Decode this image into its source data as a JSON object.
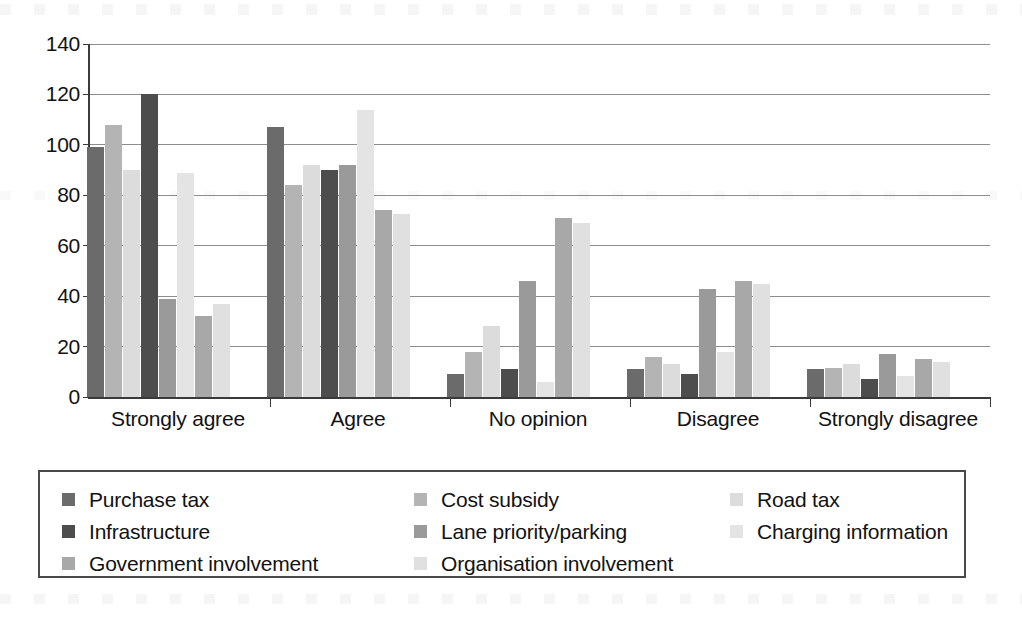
{
  "chart_data": {
    "type": "bar",
    "title": "",
    "xlabel": "",
    "ylabel": "",
    "ylim": [
      0,
      140
    ],
    "ytick_step": 20,
    "yticks": [
      0,
      20,
      40,
      60,
      80,
      100,
      120,
      140
    ],
    "grid": true,
    "legend_position": "bottom",
    "legend_columns": 3,
    "categories": [
      "Strongly agree",
      "Agree",
      "No opinion",
      "Disagree",
      "Strongly disagree"
    ],
    "series": [
      {
        "name": "Purchase tax",
        "color": "#6b6b6b",
        "values": [
          99,
          107,
          9,
          11,
          11
        ]
      },
      {
        "name": "Cost subsidy",
        "color": "#b4b4b4",
        "values": [
          108,
          84,
          18,
          16,
          11.5
        ]
      },
      {
        "name": "Road tax",
        "color": "#dcdcdc",
        "values": [
          90,
          92,
          28,
          13,
          13
        ]
      },
      {
        "name": "Infrastructure",
        "color": "#4d4d4d",
        "values": [
          120,
          90,
          11,
          9,
          7
        ]
      },
      {
        "name": "Lane priority/parking",
        "color": "#9a9a9a",
        "values": [
          39,
          92,
          46,
          43,
          17
        ]
      },
      {
        "name": "Charging information",
        "color": "#e4e4e4",
        "values": [
          89,
          114,
          6,
          18,
          8.5
        ]
      },
      {
        "name": "Government involvement",
        "color": "#a8a8a8",
        "values": [
          32,
          74,
          71,
          46,
          15
        ]
      },
      {
        "name": "Organisation involvement",
        "color": "#e0e0e0",
        "values": [
          37,
          72.5,
          69,
          45,
          14
        ]
      }
    ],
    "legend_order": [
      "Purchase tax",
      "Cost subsidy",
      "Road tax",
      "Infrastructure",
      "Lane priority/parking",
      "Charging information",
      "Government involvement",
      "Organisation involvement"
    ]
  }
}
